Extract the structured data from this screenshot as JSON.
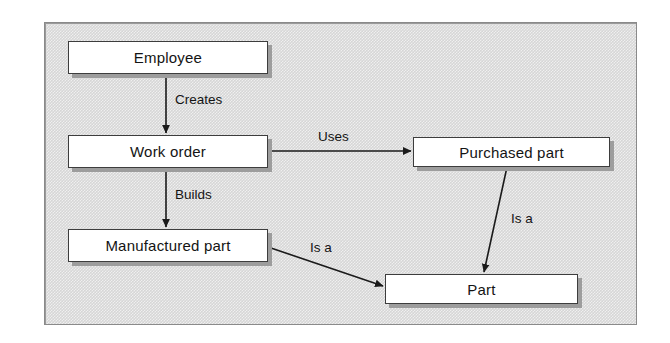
{
  "diagram": {
    "background_color": "#d6d6d6",
    "frame_border_color": "#8a8a8a",
    "node_fill_color": "#ffffff",
    "node_border_color": "#3d3d3d",
    "node_shadow_color": "#9d9d9d",
    "connector_color": "#1a1a1a",
    "nodes": [
      {
        "id": "employee",
        "label": "Employee",
        "x": 68,
        "y": 41,
        "w": 200,
        "h": 33
      },
      {
        "id": "work-order",
        "label": "Work order",
        "x": 68,
        "y": 135,
        "w": 200,
        "h": 33
      },
      {
        "id": "manufactured-part",
        "label": "Manufactured part",
        "x": 68,
        "y": 229,
        "w": 200,
        "h": 33
      },
      {
        "id": "purchased-part",
        "label": "Purchased part",
        "x": 413,
        "y": 137,
        "w": 197,
        "h": 30
      },
      {
        "id": "part",
        "label": "Part",
        "x": 385,
        "y": 274,
        "w": 193,
        "h": 30
      }
    ],
    "edges": [
      {
        "id": "creates",
        "label": "Creates",
        "from": "employee",
        "to": "work-order",
        "label_x": 175,
        "label_y": 92
      },
      {
        "id": "uses",
        "label": "Uses",
        "from": "work-order",
        "to": "purchased-part",
        "label_x": 318,
        "label_y": 129
      },
      {
        "id": "builds",
        "label": "Builds",
        "from": "work-order",
        "to": "manufactured-part",
        "label_x": 175,
        "label_y": 187
      },
      {
        "id": "is-a-purchased",
        "label": "Is a",
        "from": "purchased-part",
        "to": "part",
        "label_x": 511,
        "label_y": 211
      },
      {
        "id": "is-a-manufactured",
        "label": "Is a",
        "from": "manufactured-part",
        "to": "part",
        "label_x": 310,
        "label_y": 240
      }
    ]
  }
}
